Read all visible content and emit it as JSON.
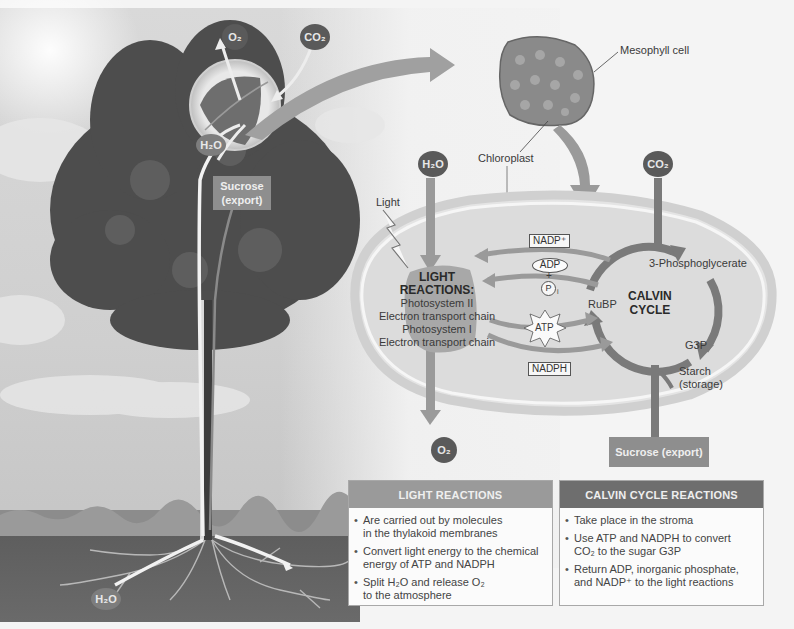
{
  "tree": {
    "o2_top": "O₂",
    "co2_top": "CO₂",
    "h2o_leaf": "H₂O",
    "sucrose_export": [
      "Sucrose",
      "(export)"
    ],
    "h2o_roots": "H₂O"
  },
  "cell": {
    "mesophyll_label": "Mesophyll cell",
    "chloroplast_label": "Chloroplast"
  },
  "chloroplast": {
    "h2o_input": "H₂O",
    "co2_input": "CO₂",
    "light_label": "Light",
    "light_reactions": {
      "title_line1": "LIGHT",
      "title_line2": "REACTIONS:",
      "lines": [
        "Photosystem II",
        "Electron transport chain",
        "Photosystem I",
        "Electron transport chain"
      ]
    },
    "nadp_plus": "NADP⁺",
    "adp": "ADP",
    "plus": "+",
    "pi": "P",
    "pi_sub": "i",
    "atp": "ATP",
    "nadph": "NADPH",
    "calvin_cycle": {
      "line1": "CALVIN",
      "line2": "CYCLE"
    },
    "three_pga": "3-Phosphoglycerate",
    "rubp": "RuBP",
    "g3p": "G3P",
    "starch": [
      "Starch",
      "(storage)"
    ],
    "o2_output": "O₂",
    "sucrose_output": "Sucrose (export)"
  },
  "summary": {
    "light_reactions": {
      "heading": "LIGHT REACTIONS",
      "bullets": [
        [
          "Are carried out by molecules",
          "in the thylakoid membranes"
        ],
        [
          "Convert light energy to the chemical",
          "energy of ATP and NADPH"
        ],
        [
          "Split H₂O and release O₂",
          "to the atmosphere"
        ]
      ]
    },
    "calvin_cycle": {
      "heading": "CALVIN CYCLE REACTIONS",
      "bullets": [
        [
          "Take place in the stroma"
        ],
        [
          "Use ATP and NADPH to convert",
          "CO₂ to the sugar G3P"
        ],
        [
          "Return ADP, inorganic phosphate,",
          "and NADP⁺ to the light reactions"
        ]
      ]
    }
  },
  "colors": {
    "dark_node": "#5a5a5a",
    "arrow_gray": "#8a8a8a",
    "light_head": "#9a9a9a",
    "calvin_head": "#6e6e6e"
  }
}
